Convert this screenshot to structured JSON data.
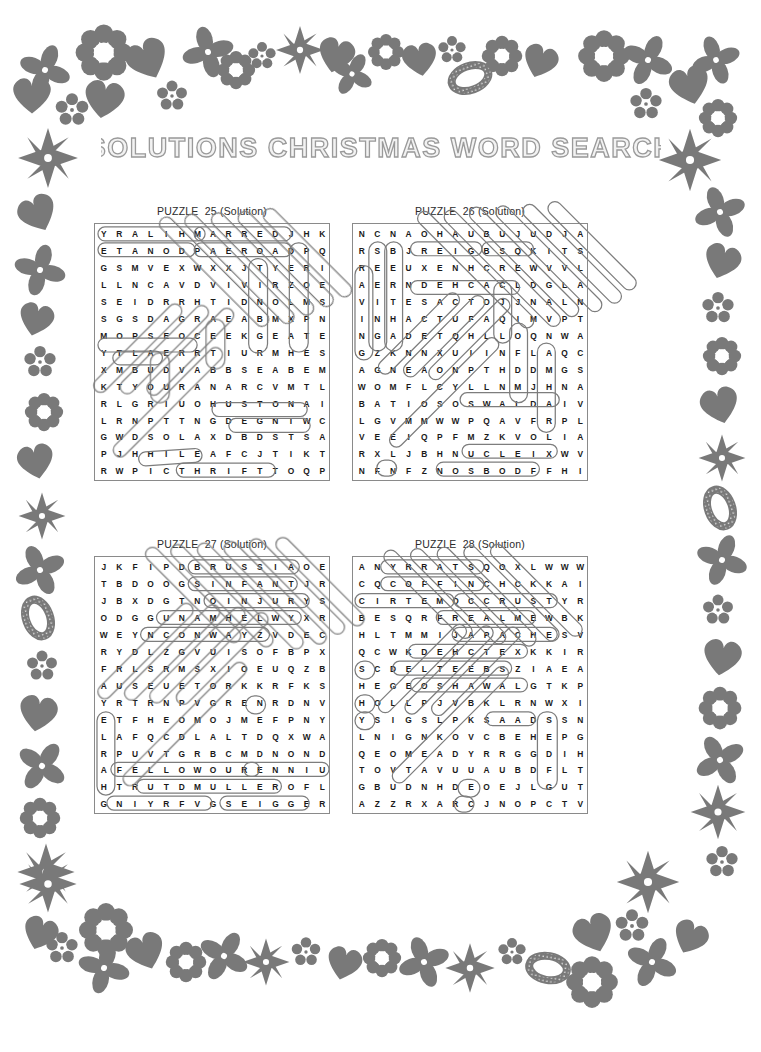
{
  "page": {
    "title": "SOLUTIONS CHRISTMAS WORD SEARCH",
    "background_color": "#ffffff",
    "ink_color": "#1a1a1a",
    "solution_outline_color": "#7d7d7d",
    "border_color": "#6e6e6e",
    "border_motif": "floral-hearts-snowflakes-decorative-frame"
  },
  "puzzles": [
    {
      "id": "p25",
      "label": "PUZZLE  25 (Solution)",
      "cols": 14,
      "rows": 16,
      "rows_text": [
        "YRALIHMARREDJHK",
        "ETANODPAEROADPQ",
        "GSMVEXWXXJTYERI",
        "LLNCAVDVIVIRZOE",
        "SEIDRRHTIDNOLMS",
        "SGSDAGRAEABMXPN",
        "MOPSEOCEEKGEATE",
        "YTLAERRTIURMHES",
        "XMBUDVABBSEABEM",
        "KTYOURANARCVMTL",
        "RLGRIUOHUSTONAIV",
        "LRNPTTNGDEGNIWC",
        "GWDSOLAXDBDSTSA",
        "PJHHILEAFCJTIKT",
        "RWPICTHRIFTTOQP"
      ],
      "grid": [
        [
          "Y",
          "R",
          "A",
          "L",
          "I",
          "H",
          "M",
          "A",
          "R",
          "R",
          "E",
          "D",
          "J",
          "H",
          "K"
        ],
        [
          "E",
          "T",
          "A",
          "N",
          "O",
          "D",
          "P",
          "A",
          "E",
          "R",
          "O",
          "A",
          "D",
          "P",
          "Q"
        ],
        [
          "G",
          "S",
          "M",
          "V",
          "E",
          "X",
          "W",
          "X",
          "X",
          "J",
          "T",
          "Y",
          "E",
          "R",
          "I"
        ],
        [
          "L",
          "L",
          "N",
          "C",
          "A",
          "V",
          "D",
          "V",
          "I",
          "V",
          "I",
          "R",
          "Z",
          "O",
          "E"
        ],
        [
          "S",
          "E",
          "I",
          "D",
          "R",
          "R",
          "H",
          "T",
          "I",
          "D",
          "N",
          "O",
          "L",
          "M",
          "S"
        ],
        [
          "S",
          "G",
          "S",
          "D",
          "A",
          "G",
          "R",
          "A",
          "E",
          "A",
          "B",
          "M",
          "X",
          "P",
          "N"
        ],
        [
          "M",
          "O",
          "P",
          "S",
          "E",
          "O",
          "C",
          "E",
          "E",
          "K",
          "G",
          "E",
          "A",
          "T",
          "E"
        ],
        [
          "Y",
          "T",
          "L",
          "A",
          "E",
          "R",
          "R",
          "T",
          "I",
          "U",
          "R",
          "M",
          "H",
          "E",
          "S"
        ],
        [
          "X",
          "M",
          "B",
          "U",
          "D",
          "V",
          "A",
          "B",
          "B",
          "S",
          "E",
          "A",
          "B",
          "E",
          "M"
        ],
        [
          "K",
          "T",
          "Y",
          "O",
          "U",
          "R",
          "A",
          "N",
          "A",
          "R",
          "C",
          "V",
          "M",
          "T",
          "L"
        ],
        [
          "R",
          "L",
          "G",
          "R",
          "I",
          "U",
          "O",
          "H",
          "U",
          "S",
          "T",
          "O",
          "N",
          "A",
          "I"
        ],
        [
          "L",
          "R",
          "N",
          "P",
          "T",
          "T",
          "N",
          "G",
          "D",
          "E",
          "G",
          "N",
          "I",
          "W",
          "C"
        ],
        [
          "G",
          "W",
          "D",
          "S",
          "O",
          "L",
          "A",
          "X",
          "D",
          "B",
          "D",
          "S",
          "T",
          "S",
          "A"
        ],
        [
          "P",
          "J",
          "H",
          "H",
          "I",
          "L",
          "E",
          "A",
          "F",
          "C",
          "J",
          "T",
          "I",
          "K",
          "T"
        ],
        [
          "R",
          "W",
          "P",
          "I",
          "C",
          "T",
          "H",
          "R",
          "I",
          "F",
          "T",
          "T",
          "O",
          "Q",
          "P"
        ]
      ],
      "found_words": [
        "MARRED",
        "PAEROAD",
        "HUSTON",
        "DEGNI",
        "THRIFT",
        "HILE",
        "PICT"
      ]
    },
    {
      "id": "p26",
      "label": "PUZZLE  26 (Solution)",
      "cols": 15,
      "rows": 16,
      "grid": [
        [
          "N",
          "C",
          "N",
          "A",
          "O",
          "H",
          "A",
          "U",
          "B",
          "U",
          "J",
          "U",
          "D",
          "J",
          "A"
        ],
        [
          "R",
          "S",
          "B",
          "J",
          "R",
          "E",
          "I",
          "G",
          "B",
          "S",
          "Q",
          "K",
          "I",
          "T",
          "S"
        ],
        [
          "R",
          "E",
          "E",
          "U",
          "X",
          "E",
          "N",
          "H",
          "C",
          "R",
          "E",
          "W",
          "V",
          "V",
          "L"
        ],
        [
          "A",
          "E",
          "R",
          "N",
          "D",
          "E",
          "H",
          "C",
          "A",
          "C",
          "L",
          "D",
          "G",
          "L",
          "A"
        ],
        [
          "V",
          "I",
          "T",
          "E",
          "S",
          "A",
          "C",
          "T",
          "O",
          "J",
          "J",
          "N",
          "A",
          "L",
          "N"
        ],
        [
          "I",
          "N",
          "H",
          "A",
          "C",
          "T",
          "U",
          "F",
          "A",
          "Q",
          "I",
          "M",
          "V",
          "P",
          "T"
        ],
        [
          "N",
          "G",
          "A",
          "D",
          "E",
          "T",
          "Q",
          "H",
          "L",
          "L",
          "O",
          "Q",
          "N",
          "W",
          "A"
        ],
        [
          "G",
          "Z",
          "K",
          "N",
          "N",
          "X",
          "U",
          "I",
          "I",
          "N",
          "F",
          "L",
          "A",
          "Q",
          "C"
        ],
        [
          "A",
          "G",
          "N",
          "E",
          "A",
          "O",
          "N",
          "P",
          "T",
          "H",
          "D",
          "D",
          "M",
          "G",
          "S"
        ],
        [
          "W",
          "O",
          "M",
          "F",
          "L",
          "C",
          "Y",
          "L",
          "L",
          "N",
          "M",
          "J",
          "H",
          "N",
          "A"
        ],
        [
          "B",
          "A",
          "T",
          "I",
          "O",
          "S",
          "O",
          "S",
          "W",
          "A",
          "L",
          "D",
          "A",
          "I",
          "V"
        ],
        [
          "L",
          "G",
          "V",
          "M",
          "M",
          "W",
          "W",
          "P",
          "Q",
          "A",
          "V",
          "F",
          "R",
          "P",
          "L"
        ],
        [
          "V",
          "E",
          "E",
          "I",
          "Q",
          "P",
          "F",
          "M",
          "Z",
          "K",
          "V",
          "O",
          "L",
          "I",
          "A"
        ],
        [
          "R",
          "X",
          "L",
          "J",
          "B",
          "H",
          "N",
          "U",
          "C",
          "L",
          "E",
          "I",
          "X",
          "W",
          "V"
        ],
        [
          "N",
          "F",
          "N",
          "F",
          "Z",
          "N",
          "O",
          "S",
          "B",
          "O",
          "D",
          "F",
          "F",
          "H",
          "I"
        ]
      ],
      "found_words": [
        "SEEING",
        "BERTHA",
        "DEHCAC",
        "OSWALD",
        "NUCLEI",
        "NOSBOD",
        "MARHA",
        "SIGNQ"
      ]
    },
    {
      "id": "p27",
      "label": "PUZZLE  27 (Solution)",
      "cols": 15,
      "rows": 16,
      "grid": [
        [
          "J",
          "K",
          "F",
          "I",
          "P",
          "D",
          "B",
          "R",
          "U",
          "S",
          "S",
          "I",
          "A",
          "O",
          "E"
        ],
        [
          "T",
          "B",
          "D",
          "O",
          "O",
          "G",
          "S",
          "I",
          "N",
          "F",
          "A",
          "N",
          "T",
          "J",
          "R"
        ],
        [
          "J",
          "B",
          "X",
          "D",
          "G",
          "T",
          "N",
          "O",
          "I",
          "N",
          "J",
          "U",
          "R",
          "Y",
          "S"
        ],
        [
          "O",
          "D",
          "G",
          "G",
          "U",
          "N",
          "A",
          "M",
          "H",
          "E",
          "L",
          "W",
          "Y",
          "X",
          "R"
        ],
        [
          "W",
          "E",
          "Y",
          "N",
          "C",
          "O",
          "N",
          "W",
          "A",
          "Y",
          "Z",
          "V",
          "D",
          "E",
          "C"
        ],
        [
          "R",
          "Y",
          "D",
          "L",
          "Z",
          "G",
          "V",
          "U",
          "I",
          "S",
          "O",
          "F",
          "B",
          "P",
          "X"
        ],
        [
          "F",
          "R",
          "L",
          "S",
          "R",
          "M",
          "S",
          "X",
          "I",
          "O",
          "E",
          "U",
          "Q",
          "Z",
          "B"
        ],
        [
          "A",
          "U",
          "S",
          "E",
          "U",
          "E",
          "T",
          "O",
          "R",
          "K",
          "K",
          "R",
          "F",
          "K",
          "S"
        ],
        [
          "Y",
          "R",
          "T",
          "R",
          "N",
          "P",
          "V",
          "G",
          "R",
          "E",
          "N",
          "R",
          "D",
          "N",
          "V"
        ],
        [
          "E",
          "T",
          "F",
          "H",
          "E",
          "O",
          "M",
          "O",
          "J",
          "M",
          "E",
          "F",
          "P",
          "N",
          "Y"
        ],
        [
          "L",
          "A",
          "F",
          "Q",
          "C",
          "D",
          "L",
          "A",
          "L",
          "T",
          "D",
          "Q",
          "X",
          "W",
          "A"
        ],
        [
          "R",
          "P",
          "U",
          "V",
          "T",
          "G",
          "R",
          "B",
          "C",
          "M",
          "D",
          "N",
          "O",
          "N",
          "D"
        ],
        [
          "A",
          "F",
          "E",
          "L",
          "L",
          "O",
          "W",
          "O",
          "U",
          "R",
          "E",
          "N",
          "N",
          "I",
          "U"
        ],
        [
          "H",
          "T",
          "R",
          "U",
          "T",
          "D",
          "M",
          "U",
          "L",
          "L",
          "E",
          "R",
          "O",
          "F",
          "L"
        ],
        [
          "G",
          "N",
          "I",
          "Y",
          "R",
          "F",
          "V",
          "G",
          "S",
          "E",
          "I",
          "G",
          "G",
          "E",
          "R"
        ]
      ],
      "found_words": [
        "RUSSIA",
        "INFANT",
        "INJURY",
        "NAMHEL",
        "CONWAY",
        "FELLOW",
        "MULLER",
        "RENNI",
        "EIGGER",
        "TRUTD"
      ]
    },
    {
      "id": "p28",
      "label": "PUZZLE  28 (Solution)",
      "cols": 15,
      "rows": 16,
      "grid": [
        [
          "A",
          "N",
          "Y",
          "R",
          "R",
          "A",
          "T",
          "S",
          "Q",
          "O",
          "X",
          "L",
          "W",
          "W",
          "W"
        ],
        [
          "C",
          "Q",
          "C",
          "O",
          "F",
          "F",
          "I",
          "N",
          "C",
          "H",
          "C",
          "K",
          "K",
          "A",
          "I"
        ],
        [
          "C",
          "I",
          "R",
          "T",
          "E",
          "M",
          "O",
          "C",
          "C",
          "R",
          "U",
          "S",
          "T",
          "Y",
          "R"
        ],
        [
          "B",
          "E",
          "S",
          "Q",
          "R",
          "F",
          "R",
          "E",
          "A",
          "L",
          "M",
          "E",
          "W",
          "B",
          "K"
        ],
        [
          "H",
          "L",
          "T",
          "M",
          "M",
          "I",
          "J",
          "A",
          "P",
          "A",
          "C",
          "H",
          "E",
          "S",
          "V"
        ],
        [
          "Q",
          "C",
          "W",
          "K",
          "D",
          "E",
          "H",
          "C",
          "T",
          "E",
          "X",
          "K",
          "K",
          "I",
          "R"
        ],
        [
          "S",
          "C",
          "D",
          "E",
          "L",
          "T",
          "E",
          "E",
          "B",
          "S",
          "Z",
          "I",
          "A",
          "E",
          "A"
        ],
        [
          "H",
          "E",
          "G",
          "E",
          "O",
          "S",
          "H",
          "A",
          "W",
          "A",
          "L",
          "G",
          "T",
          "K",
          "P"
        ],
        [
          "H",
          "O",
          "L",
          "L",
          "P",
          "J",
          "V",
          "B",
          "K",
          "L",
          "R",
          "N",
          "W",
          "X",
          "I"
        ],
        [
          "Y",
          "S",
          "I",
          "G",
          "S",
          "L",
          "P",
          "K",
          "S",
          "A",
          "A",
          "D",
          "S",
          "S",
          "N"
        ],
        [
          "L",
          "N",
          "I",
          "G",
          "N",
          "K",
          "O",
          "V",
          "C",
          "B",
          "E",
          "H",
          "E",
          "P",
          "G"
        ],
        [
          "Q",
          "E",
          "O",
          "M",
          "E",
          "A",
          "D",
          "Y",
          "R",
          "R",
          "G",
          "G",
          "D",
          "I",
          "H"
        ],
        [
          "T",
          "O",
          "V",
          "T",
          "A",
          "V",
          "U",
          "U",
          "A",
          "U",
          "B",
          "D",
          "F",
          "L",
          "T"
        ],
        [
          "G",
          "B",
          "U",
          "D",
          "N",
          "H",
          "D",
          "E",
          "O",
          "E",
          "J",
          "L",
          "G",
          "U",
          "T"
        ],
        [
          "A",
          "Z",
          "Z",
          "R",
          "X",
          "A",
          "R",
          "C",
          "J",
          "N",
          "O",
          "P",
          "C",
          "T",
          "V"
        ]
      ],
      "found_words": [
        "STARRY",
        "COFFIN",
        "CIRTEM",
        "CRUSTY",
        "REALME",
        "APACHES",
        "DEHCTE",
        "ELTEEB",
        "OSHAWA",
        "SAADS",
        "HOLL",
        "MEADY"
      ]
    }
  ]
}
